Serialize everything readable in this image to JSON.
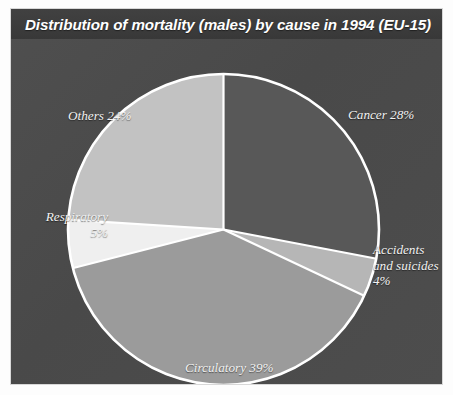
{
  "panel": {
    "title": "Distribution of mortality (males) by cause in 1994 (EU-15)",
    "background_color": "#4c4c4c",
    "title_bar_color": "#3b3b3b",
    "border_color": "#d8d8d8"
  },
  "labels": {
    "cancer": "Cancer 28%",
    "accidents": "Accidents\nand suicides\n4%",
    "circulatory": "Circulatory 39%",
    "respiratory": "Respiratory\n5%",
    "others": "Others 24%"
  },
  "chart_data": {
    "type": "pie",
    "title": "Distribution of mortality (males) by cause in 1994 (EU-15)",
    "xlabel": "",
    "ylabel": "",
    "units": "percent",
    "total": 100,
    "start_angle_deg": 0,
    "direction": "clockwise",
    "legend": "none (direct labels)",
    "grid": false,
    "categories": [
      "Cancer",
      "Accidents and suicides",
      "Circulatory",
      "Respiratory",
      "Others"
    ],
    "values": [
      28,
      4,
      39,
      5,
      24
    ],
    "slices": [
      {
        "name": "Cancer",
        "value": 28,
        "label": "Cancer 28%",
        "color": "#585858",
        "start_deg": 0,
        "end_deg": 100.8
      },
      {
        "name": "Accidents and suicides",
        "value": 4,
        "label": "Accidents and suicides 4%",
        "color": "#b6b6b6",
        "start_deg": 100.8,
        "end_deg": 115.2
      },
      {
        "name": "Circulatory",
        "value": 39,
        "label": "Circulatory 39%",
        "color": "#9b9b9b",
        "start_deg": 115.2,
        "end_deg": 255.6
      },
      {
        "name": "Respiratory",
        "value": 5,
        "label": "Respiratory 5%",
        "color": "#efefef",
        "start_deg": 255.6,
        "end_deg": 273.6
      },
      {
        "name": "Others",
        "value": 24,
        "label": "Others 24%",
        "color": "#c2c2c2",
        "start_deg": 273.6,
        "end_deg": 360
      }
    ],
    "slice_separator_color": "#ffffff",
    "outline_color": "#ffffff"
  }
}
